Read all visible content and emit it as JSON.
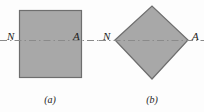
{
  "figure": {
    "background_color": "#fdfdfd",
    "width": 204,
    "height": 112,
    "shape_fill_color": "#a8a8a8",
    "shape_stroke_color": "#6e6e6e",
    "axis_line_color": "#8a8a8a",
    "text_color": "#1c1c1c"
  },
  "panels": [
    {
      "id": "a",
      "caption": "(a)",
      "shape": "square",
      "left_label": "N",
      "right_label": "A",
      "geometry": {
        "x": 19,
        "y": 10,
        "width": 63,
        "height": 68
      }
    },
    {
      "id": "b",
      "caption": "(b)",
      "shape": "diamond",
      "left_label": "N",
      "right_label": "A",
      "geometry": {
        "left_vertex": [
          115,
          40
        ],
        "top_vertex": [
          152,
          6
        ],
        "right_vertex": [
          188,
          40
        ],
        "bottom_vertex": [
          152,
          79
        ]
      }
    }
  ],
  "axis": {
    "name": "neutral-axis-centerline",
    "style": "dash-dot",
    "y": 40,
    "segments": [
      {
        "x1": 0,
        "x2": 99
      },
      {
        "x1": 99,
        "x2": 204
      }
    ]
  }
}
